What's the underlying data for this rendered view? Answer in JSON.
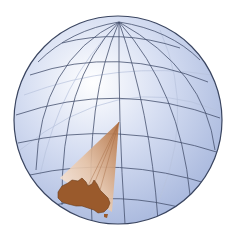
{
  "figure": {
    "colors": {
      "background": "#ffffff",
      "globe_light": "#ffffff",
      "globe_mid": "#c8d4ee",
      "globe_dark": "#9fb0d8",
      "grid_line": "#3e4a66",
      "outline": "#2f3a55",
      "continent": "#9a5a2c",
      "continent_edge": "#5e3417",
      "cone_light": "#fbece0",
      "cone_dark": "#c08055"
    },
    "globe": {
      "cx": 118,
      "cy": 120,
      "r": 104
    },
    "labels": []
  }
}
